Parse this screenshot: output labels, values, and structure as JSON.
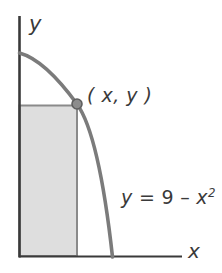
{
  "figure": {
    "axes": {
      "y_axis_label": "y",
      "x_axis_label": "x",
      "axis_color": "#3a3a3a"
    },
    "labels": {
      "point_label": "( x, y )",
      "equation_y": "y",
      "equation_equals": " = ",
      "equation_value": "9",
      "equation_minus": " – ",
      "equation_variable": "x",
      "equation_exponent": "2"
    },
    "colors": {
      "curve": "#7b7b7b",
      "shade_fill": "#dedede",
      "shade_border": "#8a8a8a",
      "point_fill": "#8c8c8c",
      "point_stroke": "#5f5f5f",
      "axis": "#3a3a3a",
      "background": "#ffffff"
    },
    "geometry": {
      "y_axis_x": 19,
      "y_axis_top": 16,
      "x_axis_y": 256,
      "x_axis_left": 19,
      "x_axis_right": 182,
      "curve_y_intercept_y": 53,
      "curve_x_intercept_x": 112,
      "point_x": 77,
      "point_y": 104,
      "rect_left": 19,
      "rect_right": 77,
      "rect_top": 105,
      "rect_bottom": 256
    }
  }
}
